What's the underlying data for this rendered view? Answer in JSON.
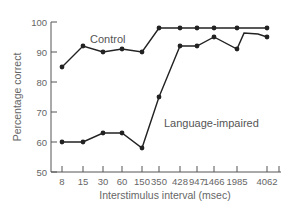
{
  "chart_data": {
    "type": "line",
    "title": "",
    "xlabel": "Interstimulus interval (msec)",
    "ylabel": "Percentage correct",
    "categories": [
      "8",
      "15",
      "30",
      "60",
      "150",
      "350",
      "428",
      "947",
      "1466",
      "1985",
      "4062"
    ],
    "series": [
      {
        "name": "Control",
        "values": [
          85,
          92,
          90,
          91,
          90,
          98,
          98,
          98,
          98,
          98,
          98
        ]
      },
      {
        "name": "Language-impaired",
        "values": [
          60,
          60,
          63,
          63,
          58,
          75,
          92,
          92,
          95,
          91,
          95
        ]
      }
    ],
    "ylim": [
      50,
      100
    ],
    "yticks": [
      50,
      60,
      70,
      80,
      90,
      100
    ],
    "grid": false,
    "legend": "inline labels on lines",
    "annotations": [
      "Control",
      "Language-impaired"
    ]
  },
  "colors": {
    "line": "#222222",
    "axis": "#555555",
    "text": "#666666"
  }
}
